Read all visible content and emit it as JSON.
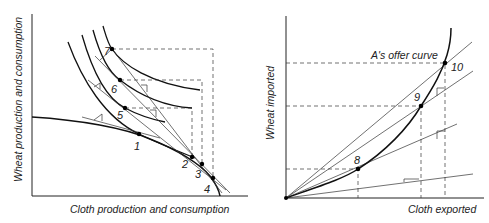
{
  "left_panel": {
    "y_axis_label": "Wheat production and consumption",
    "x_axis_label": "Cloth production and consumption",
    "points": [
      {
        "id": "1",
        "label": "1"
      },
      {
        "id": "2",
        "label": "2"
      },
      {
        "id": "3",
        "label": "3"
      },
      {
        "id": "4",
        "label": "4"
      },
      {
        "id": "5",
        "label": "5"
      },
      {
        "id": "6",
        "label": "6"
      },
      {
        "id": "7",
        "label": "7"
      }
    ]
  },
  "right_panel": {
    "y_axis_label": "Wheat imported",
    "x_axis_label": "Cloth exported",
    "curve_label": "A's offer curve",
    "points": [
      {
        "id": "8",
        "label": "8"
      },
      {
        "id": "9",
        "label": "9"
      },
      {
        "id": "10",
        "label": "10"
      }
    ]
  }
}
